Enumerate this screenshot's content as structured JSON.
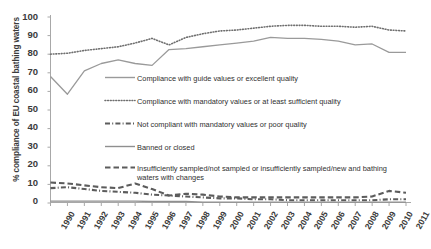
{
  "axes": {
    "ylabel": "% compliance of EU coastal bathing waters",
    "yticks": [
      "100",
      "90",
      "80",
      "70",
      "60",
      "50",
      "40",
      "30",
      "20",
      "10",
      "0"
    ],
    "xticks": [
      "1990",
      "1991",
      "1992",
      "1993",
      "1994",
      "1995",
      "1996",
      "1997",
      "1998",
      "1999",
      "2000",
      "2001",
      "2002",
      "2003",
      "2004",
      "2005",
      "2006",
      "2007",
      "2008",
      "2009",
      "2010",
      "2011"
    ]
  },
  "legend": {
    "items": [
      {
        "label": "Compliance with guide values or excellent quality",
        "style": "solid-thin",
        "color": "#9a9a9a"
      },
      {
        "label": "Compliance with mandatory values or at least sufficient quality",
        "style": "dotted",
        "color": "#6f6f6f"
      },
      {
        "label": "Not compliant with mandatory values or poor quality",
        "style": "dash-dot-thick",
        "color": "#5c5c5c"
      },
      {
        "label": "Banned or closed",
        "style": "solid-thin",
        "color": "#8f8f8f"
      },
      {
        "label": "Insufficiently sampled/not sampled or insufficiently sampled/new and bathing waters with changes",
        "style": "dashed-thick",
        "color": "#5c5c5c"
      }
    ]
  },
  "colors": {
    "axis": "#a8a8a8",
    "text": "#3b3b3b",
    "guide": "#9a9a9a",
    "mandatory": "#6f6f6f",
    "noncompliant": "#5c5c5c",
    "banned": "#8f8f8f",
    "insufficient": "#5c5c5c",
    "background": "#ffffff"
  },
  "chart_data": {
    "type": "line",
    "title": "",
    "xlabel": "",
    "ylabel": "% compliance of EU coastal bathing waters",
    "ylim": [
      0,
      100
    ],
    "ytick_step": 10,
    "grid": false,
    "legend_position": "inside-center",
    "x": [
      "1990",
      "1991",
      "1992",
      "1993",
      "1994",
      "1995",
      "1996",
      "1997",
      "1998",
      "1999",
      "2000",
      "2001",
      "2002",
      "2003",
      "2004",
      "2005",
      "2006",
      "2007",
      "2008",
      "2009",
      "2010",
      "2011"
    ],
    "series": [
      {
        "name": "Compliance with guide values or excellent quality",
        "style": "solid-thin",
        "color": "#9a9a9a",
        "values": [
          68,
          58.5,
          71,
          75,
          77,
          75,
          74,
          82.5,
          83,
          84,
          85,
          86,
          87,
          89,
          88.5,
          88.5,
          88,
          87,
          85,
          85.5,
          81,
          81
        ]
      },
      {
        "name": "Compliance with mandatory values or at least sufficient quality",
        "style": "dotted",
        "color": "#6f6f6f",
        "values": [
          80,
          80.5,
          82,
          83,
          84,
          86,
          88.5,
          85,
          89,
          91,
          92.5,
          93,
          94,
          95,
          95.5,
          95.5,
          95,
          95,
          94.5,
          95,
          93,
          92.5
        ]
      },
      {
        "name": "Not compliant with mandatory values or poor quality",
        "style": "dash-dot-thick",
        "color": "#5c5c5c",
        "values": [
          8,
          8.5,
          7.5,
          6.5,
          6,
          5.5,
          4.5,
          4,
          3.5,
          3,
          2.5,
          2.5,
          2,
          2,
          1.5,
          1.5,
          1.5,
          1.5,
          1.5,
          1.5,
          2,
          2
        ]
      },
      {
        "name": "Banned or closed",
        "style": "solid-thin",
        "color": "#8f8f8f",
        "values": [
          1,
          1,
          1,
          1,
          1,
          1,
          0.8,
          0.8,
          0.8,
          0.5,
          0.5,
          0.5,
          0.5,
          0.5,
          0.5,
          0.5,
          0.5,
          0.5,
          0.5,
          0.5,
          0.5,
          0.5
        ]
      },
      {
        "name": "Insufficiently sampled/not sampled or insufficiently sampled/new and bathing waters with changes",
        "style": "dashed-thick",
        "color": "#5c5c5c",
        "values": [
          11,
          10.5,
          9.5,
          8.5,
          8,
          10.5,
          7.5,
          4,
          5,
          4.5,
          3.5,
          3,
          3,
          3,
          3,
          3,
          3,
          3,
          3,
          3.5,
          6.5,
          5.5
        ]
      }
    ]
  }
}
